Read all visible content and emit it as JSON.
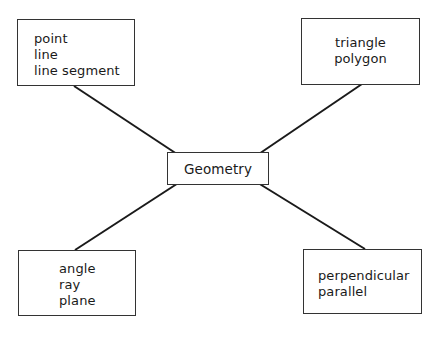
{
  "diagram": {
    "type": "concept-map",
    "center": {
      "label": "Geometry"
    },
    "nodes": [
      {
        "id": "top-left",
        "items": [
          "point",
          "line",
          "line segment"
        ]
      },
      {
        "id": "top-right",
        "items": [
          "triangle",
          "polygon"
        ]
      },
      {
        "id": "bottom-left",
        "items": [
          "angle",
          "ray",
          "plane"
        ]
      },
      {
        "id": "bottom-right",
        "items": [
          "perpendicular",
          "parallel"
        ]
      }
    ],
    "edges": [
      {
        "from": "Geometry",
        "to": "top-left"
      },
      {
        "from": "Geometry",
        "to": "top-right"
      },
      {
        "from": "Geometry",
        "to": "bottom-left"
      },
      {
        "from": "Geometry",
        "to": "bottom-right"
      }
    ],
    "line_color": "#1a1a1a",
    "border_color": "#333333"
  }
}
